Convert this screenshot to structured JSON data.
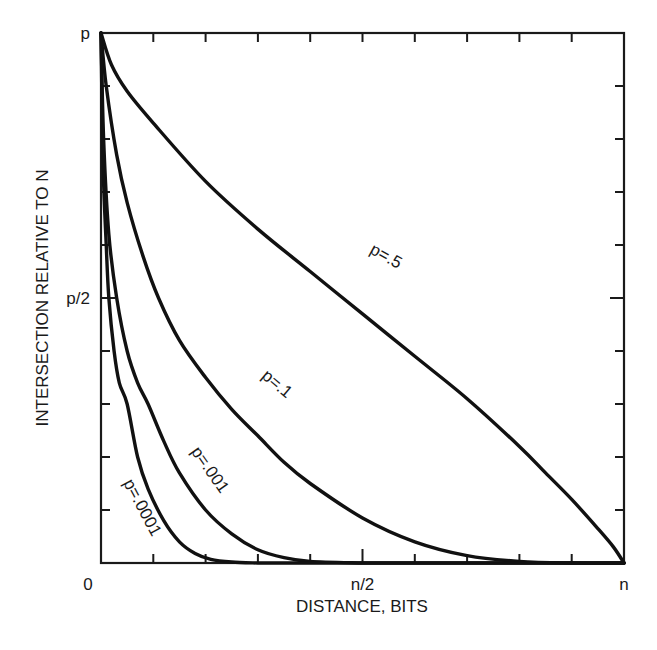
{
  "chart_data": {
    "type": "line",
    "title": "",
    "xlabel": "DISTANCE, BITS",
    "ylabel": "INTERSECTION RELATIVE TO N",
    "x_tick_labels": [
      {
        "pos": 0,
        "label": "0"
      },
      {
        "pos": 0.5,
        "label": "n/2"
      },
      {
        "pos": 1,
        "label": "n"
      }
    ],
    "y_tick_labels": [
      {
        "pos": 0.5,
        "label": "p/2"
      },
      {
        "pos": 1,
        "label": "p"
      }
    ],
    "xlim": [
      0,
      1
    ],
    "ylim": [
      0,
      1
    ],
    "x_units": "fraction of n",
    "y_units": "fraction of p",
    "minor_divisions": 10,
    "grid": false,
    "legend": "none (curves labeled inline)",
    "series": [
      {
        "name": "p = .5",
        "label_pos": [
          0.54,
          0.57
        ],
        "label_angle": 29,
        "x": [
          0,
          0.02,
          0.05,
          0.1,
          0.2,
          0.3,
          0.4,
          0.5,
          0.6,
          0.7,
          0.8,
          0.85,
          0.9,
          0.95,
          0.98,
          1.0
        ],
        "y": [
          1.0,
          0.94,
          0.89,
          0.83,
          0.72,
          0.63,
          0.55,
          0.47,
          0.39,
          0.31,
          0.22,
          0.17,
          0.12,
          0.065,
          0.03,
          0.0
        ]
      },
      {
        "name": "p = .1",
        "label_pos": [
          0.33,
          0.33
        ],
        "label_angle": 40,
        "x": [
          0,
          0.01,
          0.03,
          0.05,
          0.08,
          0.11,
          0.15,
          0.2,
          0.25,
          0.3,
          0.35,
          0.4,
          0.5,
          0.6,
          0.7,
          0.8,
          0.9,
          1.0
        ],
        "y": [
          1.0,
          0.9,
          0.77,
          0.68,
          0.58,
          0.5,
          0.42,
          0.35,
          0.29,
          0.24,
          0.19,
          0.15,
          0.085,
          0.04,
          0.014,
          0.003,
          0.0,
          0.0
        ]
      },
      {
        "name": "p = .001",
        "label_pos": [
          0.2,
          0.17
        ],
        "label_angle": 55,
        "x": [
          0,
          0.005,
          0.015,
          0.03,
          0.05,
          0.07,
          0.09,
          0.12,
          0.15,
          0.2,
          0.25,
          0.3,
          0.35,
          0.4,
          0.5
        ],
        "y": [
          1.0,
          0.8,
          0.62,
          0.5,
          0.4,
          0.34,
          0.3,
          0.23,
          0.17,
          0.1,
          0.055,
          0.025,
          0.01,
          0.003,
          0.0
        ]
      },
      {
        "name": "p = .0001",
        "label_pos": [
          0.07,
          0.1
        ],
        "label_angle": 62,
        "x": [
          0,
          0.004,
          0.01,
          0.015,
          0.025,
          0.035,
          0.05,
          0.07,
          0.09,
          0.12,
          0.15,
          0.18,
          0.21,
          0.25,
          0.3
        ],
        "y": [
          1.0,
          0.75,
          0.6,
          0.5,
          0.4,
          0.34,
          0.3,
          0.2,
          0.14,
          0.08,
          0.04,
          0.018,
          0.007,
          0.002,
          0.0
        ]
      }
    ]
  }
}
